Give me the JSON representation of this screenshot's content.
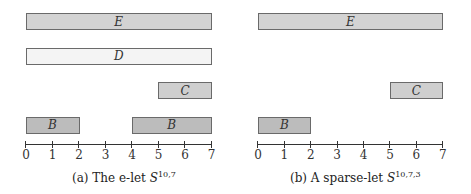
{
  "figure": {
    "panels": [
      {
        "id": "a",
        "caption_prefix": "(a) The e-let ",
        "caption_symbol": "S",
        "caption_superscript": "10,7",
        "axis": {
          "min": 0,
          "max": 7,
          "ticks": [
            "0",
            "1",
            "2",
            "3",
            "4",
            "5",
            "6",
            "7"
          ]
        },
        "intervals": [
          {
            "label": "E",
            "start": 0,
            "end": 7,
            "row": 0,
            "fill": "#d3d3d3"
          },
          {
            "label": "D",
            "start": 0,
            "end": 7,
            "row": 1,
            "fill": "#f4f4f4"
          },
          {
            "label": "C",
            "start": 5,
            "end": 7,
            "row": 2,
            "fill": "#cfcfcf"
          },
          {
            "label": "B",
            "start": 0,
            "end": 2,
            "row": 3,
            "fill": "#bcbcbc"
          },
          {
            "label": "B",
            "start": 4,
            "end": 7,
            "row": 3,
            "fill": "#bcbcbc"
          }
        ]
      },
      {
        "id": "b",
        "caption_prefix": "(b) A sparse-let ",
        "caption_symbol": "S",
        "caption_superscript": "10,7,3",
        "axis": {
          "min": 0,
          "max": 7,
          "ticks": [
            "0",
            "1",
            "2",
            "3",
            "4",
            "5",
            "6",
            "7"
          ]
        },
        "intervals": [
          {
            "label": "E",
            "start": 0,
            "end": 7,
            "row": 0,
            "fill": "#d3d3d3"
          },
          {
            "label": "C",
            "start": 5,
            "end": 7,
            "row": 2,
            "fill": "#cfcfcf"
          },
          {
            "label": "B",
            "start": 0,
            "end": 2,
            "row": 3,
            "fill": "#bcbcbc"
          }
        ]
      }
    ]
  }
}
